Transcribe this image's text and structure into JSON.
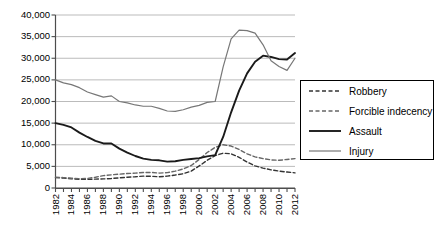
{
  "chart_data": {
    "type": "line",
    "title": "",
    "xlabel": "",
    "ylabel": "",
    "grid": true,
    "legend_position": "right",
    "ylim": [
      0,
      40000
    ],
    "ytick_labels": [
      "40,000",
      "35,000",
      "30,000",
      "25,000",
      "20,000",
      "15,000",
      "10,000",
      "5,000",
      "0"
    ],
    "ytick_values": [
      40000,
      35000,
      30000,
      25000,
      20000,
      15000,
      10000,
      5000,
      0
    ],
    "x": [
      1982,
      1983,
      1984,
      1985,
      1986,
      1987,
      1988,
      1989,
      1990,
      1991,
      1992,
      1993,
      1994,
      1995,
      1996,
      1997,
      1998,
      1999,
      2000,
      2001,
      2002,
      2003,
      2004,
      2005,
      2006,
      2007,
      2008,
      2009,
      2010,
      2011,
      2012
    ],
    "xtick_labels": [
      "1982",
      "1984",
      "1986",
      "1988",
      "1990",
      "1992",
      "1994",
      "1996",
      "1998",
      "2000",
      "2002",
      "2004",
      "2006",
      "2008",
      "2010",
      "2012"
    ],
    "xtick_values": [
      1982,
      1984,
      1986,
      1988,
      1990,
      1992,
      1994,
      1996,
      1998,
      2000,
      2002,
      2004,
      2006,
      2008,
      2010,
      2012
    ],
    "series": [
      {
        "name": "Robbery",
        "style": "dashed",
        "color": "#333333",
        "values": [
          2400,
          2300,
          2150,
          2000,
          2000,
          2050,
          2100,
          2200,
          2350,
          2500,
          2600,
          2750,
          2700,
          2600,
          2750,
          3000,
          3300,
          3900,
          5100,
          6400,
          7500,
          8050,
          7900,
          7100,
          6000,
          5100,
          4600,
          4200,
          3900,
          3700,
          3500
        ]
      },
      {
        "name": "Forcible indecency",
        "style": "dashed",
        "color": "#666666",
        "values": [
          2500,
          2400,
          2250,
          2150,
          2200,
          2500,
          2850,
          3050,
          3200,
          3350,
          3450,
          3600,
          3600,
          3450,
          3550,
          3900,
          4400,
          5200,
          6600,
          8200,
          9400,
          10000,
          9700,
          8900,
          7900,
          7200,
          6800,
          6500,
          6400,
          6600,
          6800
        ]
      },
      {
        "name": "Assault",
        "style": "solid-thick",
        "color": "#1a1a1a",
        "values": [
          15000,
          14600,
          14000,
          12800,
          11800,
          10900,
          10300,
          10300,
          9100,
          8200,
          7400,
          6800,
          6500,
          6400,
          6100,
          6200,
          6500,
          6700,
          6900,
          7300,
          7600,
          11800,
          17500,
          22500,
          26500,
          29200,
          30600,
          30300,
          29800,
          29700,
          31200
        ]
      },
      {
        "name": "Injury",
        "style": "solid-thin",
        "color": "#777777",
        "values": [
          25000,
          24300,
          23900,
          23200,
          22200,
          21600,
          21000,
          21300,
          20000,
          19700,
          19200,
          18900,
          18900,
          18400,
          17800,
          17700,
          18100,
          18700,
          19100,
          19800,
          20000,
          28000,
          34500,
          36500,
          36400,
          35800,
          33100,
          29400,
          28100,
          27200,
          30000
        ]
      }
    ]
  },
  "legend": {
    "items": [
      {
        "label": "Robbery",
        "style": "dashed"
      },
      {
        "label": "Forcible indecency",
        "style": "dashed"
      },
      {
        "label": "Assault",
        "style": "solid-thick"
      },
      {
        "label": "Injury",
        "style": "solid-thin"
      }
    ]
  }
}
